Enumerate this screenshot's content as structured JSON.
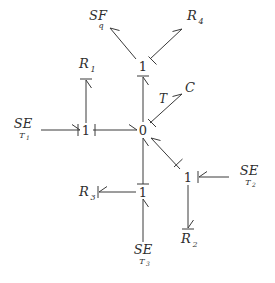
{
  "diagram": {
    "type": "bond-graph",
    "title": "",
    "background_color": "#ffffff",
    "line_color": "#3a3a3a",
    "text_color": "#2e2e2e",
    "junctions": [
      {
        "id": "j1_top",
        "label": "1",
        "x": 143,
        "y": 66
      },
      {
        "id": "j1_left",
        "label": "1",
        "x": 86,
        "y": 130
      },
      {
        "id": "j0_center",
        "label": "0",
        "x": 143,
        "y": 130
      },
      {
        "id": "j1_bottom",
        "label": "1",
        "x": 143,
        "y": 192
      },
      {
        "id": "j1_right",
        "label": "1",
        "x": 188,
        "y": 177
      }
    ],
    "elements": [
      {
        "id": "sf_q",
        "label": "SF",
        "subscript": "q",
        "x": 98,
        "y": 20
      },
      {
        "id": "r4",
        "label": "R",
        "subscript": "4",
        "x": 194,
        "y": 20
      },
      {
        "id": "r1",
        "label": "R",
        "subscript": "1",
        "x": 86,
        "y": 68
      },
      {
        "id": "c_elem",
        "label": "C",
        "subscript": "",
        "x": 190,
        "y": 92
      },
      {
        "id": "se_t1",
        "label": "SE",
        "subscript": "T",
        "sub2": "1",
        "x": 23,
        "y": 128
      },
      {
        "id": "se_t2",
        "label": "SE",
        "subscript": "T",
        "sub2": "2",
        "x": 249,
        "y": 175
      },
      {
        "id": "r3",
        "label": "R",
        "subscript": "3",
        "x": 86,
        "y": 192
      },
      {
        "id": "r2",
        "label": "R",
        "subscript": "2",
        "x": 188,
        "y": 240
      },
      {
        "id": "se_t3",
        "label": "SE",
        "subscript": "T",
        "sub2": "3",
        "x": 143,
        "y": 254
      }
    ],
    "bond_labels": [
      {
        "id": "bond_t",
        "label": "T",
        "x": 163,
        "y": 103
      }
    ],
    "bonds": [
      {
        "id": "bond-se-t1-to-1",
        "from": "se_t1",
        "to": "j1_left",
        "arrow": "at-target"
      },
      {
        "id": "bond-1-to-r1",
        "from": "j1_left",
        "to": "r1",
        "arrow": "at-target"
      },
      {
        "id": "bond-1-to-0",
        "from": "j1_left",
        "to": "j0_center",
        "arrow": "at-target"
      },
      {
        "id": "bond-0-to-1top",
        "from": "j0_center",
        "to": "j1_top",
        "arrow": "at-target"
      },
      {
        "id": "bond-1top-to-sfq",
        "from": "j1_top",
        "to": "sf_q",
        "arrow": "at-target"
      },
      {
        "id": "bond-1top-to-r4",
        "from": "j1_top",
        "to": "r4",
        "arrow": "at-target"
      },
      {
        "id": "bond-0-to-c",
        "from": "j0_center",
        "to": "c_elem",
        "arrow": "at-target",
        "label": "T"
      },
      {
        "id": "bond-1right-to-0",
        "from": "j1_right",
        "to": "j0_center",
        "arrow": "at-target"
      },
      {
        "id": "bond-se-t2-to-1",
        "from": "se_t2",
        "to": "j1_right",
        "arrow": "at-target"
      },
      {
        "id": "bond-1right-to-r2",
        "from": "j1_right",
        "to": "r2",
        "arrow": "at-target"
      },
      {
        "id": "bond-1bot-to-0",
        "from": "j1_bottom",
        "to": "j0_center",
        "arrow": "at-target"
      },
      {
        "id": "bond-1bot-to-r3",
        "from": "j1_bottom",
        "to": "r3",
        "arrow": "at-target"
      },
      {
        "id": "bond-se-t3-to-1",
        "from": "se_t3",
        "to": "j1_bottom",
        "arrow": "at-target"
      }
    ]
  }
}
